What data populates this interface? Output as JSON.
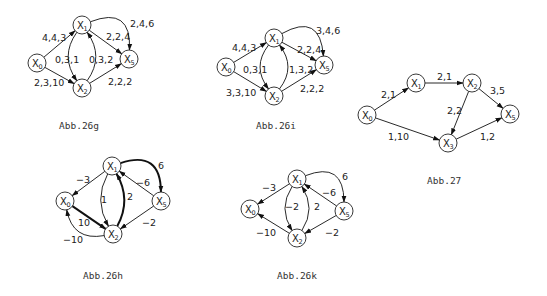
{
  "figures": [
    {
      "id": "abb26g",
      "caption": "Abb.26g",
      "caption_pos": [
        59,
        129
      ],
      "nodes": [
        {
          "id": "X0",
          "label": "X",
          "sub": "0",
          "x": 37,
          "y": 63
        },
        {
          "id": "X1",
          "label": "X",
          "sub": "1",
          "x": 82,
          "y": 25
        },
        {
          "id": "X2",
          "label": "X",
          "sub": "2",
          "x": 82,
          "y": 88
        },
        {
          "id": "X5",
          "label": "X",
          "sub": "5",
          "x": 129,
          "y": 59
        }
      ],
      "edges": [
        {
          "from": "X0",
          "to": "X1",
          "label": "4,4,3",
          "lx": 42,
          "ly": 41,
          "curve": 0
        },
        {
          "from": "X0",
          "to": "X2",
          "label": "2,3,10",
          "lx": 34,
          "ly": 86,
          "curve": 0
        },
        {
          "from": "X1",
          "to": "X2",
          "label": "0,3,1",
          "lx": 55,
          "ly": 63,
          "curve": 14
        },
        {
          "from": "X2",
          "to": "X1",
          "label": "0,3,2",
          "lx": 89,
          "ly": 63,
          "curve": 14
        },
        {
          "from": "X1",
          "to": "X5",
          "label": "2,2,4",
          "lx": 106,
          "ly": 40,
          "curve": 0
        },
        {
          "from": "X2",
          "to": "X5",
          "label": "2,2,2",
          "lx": 108,
          "ly": 85,
          "curve": 0
        },
        {
          "from": "X1",
          "to": "X5",
          "label": "2,4,6",
          "lx": 130,
          "ly": 27,
          "curve": -28
        }
      ]
    },
    {
      "id": "abb26i",
      "caption": "Abb.26i",
      "caption_pos": [
        256,
        129
      ],
      "nodes": [
        {
          "id": "X0",
          "label": "X",
          "sub": "0",
          "x": 226,
          "y": 67
        },
        {
          "id": "X1",
          "label": "X",
          "sub": "1",
          "x": 274,
          "y": 38
        },
        {
          "id": "X2",
          "label": "X",
          "sub": "2",
          "x": 274,
          "y": 96
        },
        {
          "id": "X5",
          "label": "X",
          "sub": "5",
          "x": 324,
          "y": 65
        }
      ],
      "edges": [
        {
          "from": "X0",
          "to": "X1",
          "label": "4,4,3",
          "lx": 232,
          "ly": 51,
          "curve": 0
        },
        {
          "from": "X0",
          "to": "X2",
          "label": "3,3,10",
          "lx": 226,
          "ly": 96,
          "curve": 0
        },
        {
          "from": "X1",
          "to": "X2",
          "label": "0,3,1",
          "lx": 243,
          "ly": 73,
          "curve": 14
        },
        {
          "from": "X2",
          "to": "X1",
          "label": "1,3,2",
          "lx": 289,
          "ly": 73,
          "curve": 14
        },
        {
          "from": "X1",
          "to": "X5",
          "label": "2,2,4",
          "lx": 297,
          "ly": 53,
          "curve": 0
        },
        {
          "from": "X2",
          "to": "X5",
          "label": "2,2,2",
          "lx": 300,
          "ly": 92,
          "curve": 0
        },
        {
          "from": "X1",
          "to": "X5",
          "label": "3,4,6",
          "lx": 316,
          "ly": 34,
          "curve": -28
        }
      ]
    },
    {
      "id": "abb27",
      "caption": "Abb.27",
      "caption_pos": [
        427,
        184
      ],
      "nodes": [
        {
          "id": "X0",
          "label": "X",
          "sub": "0",
          "x": 367,
          "y": 115
        },
        {
          "id": "X1",
          "label": "X",
          "sub": "1",
          "x": 416,
          "y": 83
        },
        {
          "id": "X2",
          "label": "X",
          "sub": "2",
          "x": 472,
          "y": 83
        },
        {
          "id": "X3",
          "label": "X",
          "sub": "3",
          "x": 448,
          "y": 143
        },
        {
          "id": "X5",
          "label": "X",
          "sub": "5",
          "x": 510,
          "y": 114
        }
      ],
      "edges": [
        {
          "from": "X0",
          "to": "X1",
          "label": "2,1",
          "lx": 381,
          "ly": 98,
          "curve": 0
        },
        {
          "from": "X1",
          "to": "X2",
          "label": "2,1",
          "lx": 437,
          "ly": 80,
          "curve": 0
        },
        {
          "from": "X2",
          "to": "X5",
          "label": "3,5",
          "lx": 490,
          "ly": 94,
          "curve": 0
        },
        {
          "from": "X2",
          "to": "X3",
          "label": "2,2",
          "lx": 447,
          "ly": 114,
          "curve": 0
        },
        {
          "from": "X0",
          "to": "X3",
          "label": "1,10",
          "lx": 388,
          "ly": 140,
          "curve": 0
        },
        {
          "from": "X3",
          "to": "X5",
          "label": "1,2",
          "lx": 480,
          "ly": 140,
          "curve": 0
        }
      ]
    },
    {
      "id": "abb26h",
      "caption": "Abb.26h",
      "caption_pos": [
        83,
        279
      ],
      "nodes": [
        {
          "id": "X0",
          "label": "X",
          "sub": "0",
          "x": 65,
          "y": 201
        },
        {
          "id": "X1",
          "label": "X",
          "sub": "1",
          "x": 112,
          "y": 166
        },
        {
          "id": "X2",
          "label": "X",
          "sub": "2",
          "x": 113,
          "y": 234
        },
        {
          "id": "X5",
          "label": "X",
          "sub": "5",
          "x": 161,
          "y": 201
        }
      ],
      "edges": [
        {
          "from": "X1",
          "to": "X0",
          "label": "−3",
          "lx": 76,
          "ly": 183,
          "curve": 0,
          "bold": false
        },
        {
          "from": "X0",
          "to": "X2",
          "label": "10",
          "lx": 78,
          "ly": 226,
          "curve": 0,
          "bold": true
        },
        {
          "from": "X2",
          "to": "X0",
          "label": "−10",
          "lx": 63,
          "ly": 243,
          "curve": -18,
          "bold": false
        },
        {
          "from": "X1",
          "to": "X2",
          "label": "1",
          "lx": 101,
          "ly": 203,
          "curve": 12,
          "bold": false
        },
        {
          "from": "X2",
          "to": "X1",
          "label": "2",
          "lx": 127,
          "ly": 200,
          "curve": 12,
          "bold": true
        },
        {
          "from": "X5",
          "to": "X1",
          "label": "−6",
          "lx": 136,
          "ly": 186,
          "curve": 0,
          "bold": false
        },
        {
          "from": "X5",
          "to": "X2",
          "label": "−2",
          "lx": 142,
          "ly": 226,
          "curve": 0,
          "bold": false
        },
        {
          "from": "X1",
          "to": "X5",
          "label": "6",
          "lx": 158,
          "ly": 169,
          "curve": -26,
          "bold": true
        }
      ]
    },
    {
      "id": "abb26k",
      "caption": "Abb.26k",
      "caption_pos": [
        277,
        279
      ],
      "nodes": [
        {
          "id": "X0",
          "label": "X",
          "sub": "0",
          "x": 250,
          "y": 209
        },
        {
          "id": "X1",
          "label": "X",
          "sub": "1",
          "x": 297,
          "y": 179
        },
        {
          "id": "X2",
          "label": "X",
          "sub": "2",
          "x": 297,
          "y": 238
        },
        {
          "id": "X5",
          "label": "X",
          "sub": "5",
          "x": 344,
          "y": 211
        }
      ],
      "edges": [
        {
          "from": "X1",
          "to": "X0",
          "label": "−3",
          "lx": 262,
          "ly": 191,
          "curve": 0
        },
        {
          "from": "X2",
          "to": "X0",
          "label": "−10",
          "lx": 256,
          "ly": 236,
          "curve": 0
        },
        {
          "from": "X1",
          "to": "X2",
          "label": "−2",
          "lx": 285,
          "ly": 210,
          "curve": 12
        },
        {
          "from": "X2",
          "to": "X1",
          "label": "2",
          "lx": 314,
          "ly": 210,
          "curve": 12
        },
        {
          "from": "X5",
          "to": "X1",
          "label": "−6",
          "lx": 322,
          "ly": 196,
          "curve": 0
        },
        {
          "from": "X5",
          "to": "X2",
          "label": "−2",
          "lx": 325,
          "ly": 236,
          "curve": 0
        },
        {
          "from": "X1",
          "to": "X5",
          "label": "6",
          "lx": 342,
          "ly": 180,
          "curve": -26
        }
      ]
    }
  ]
}
